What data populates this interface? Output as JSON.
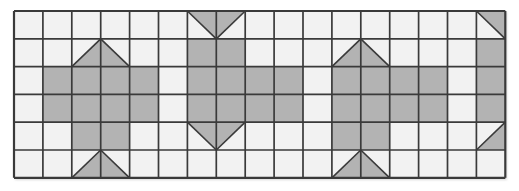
{
  "figure": {
    "title": "Quilt block grid pattern",
    "kind": "grid-tiling",
    "columns": 17,
    "rows": 6,
    "origin": {
      "x": 14,
      "y": 11
    },
    "cell_width": 28.9,
    "cell_height": 27.8
  },
  "colors": {
    "background": "#ffffff",
    "cell_empty": "#f2f2f2",
    "cell_filled": "#b3b3b3",
    "grid_line": "#3a3a3a",
    "outer_shadow": "#d9d9d9"
  },
  "legend": {
    "empty_label": "empty",
    "filled_label": "filled",
    "tri_up_label": "triangle-up",
    "tri_down_label": "triangle-down",
    "tri_ne_label": "triangle-upper-right",
    "tri_se_label": "triangle-lower-right"
  },
  "chart_data": {
    "type": "heatmap",
    "title": "Quilt block grid pattern",
    "xlabel": "",
    "ylabel": "",
    "categories": [
      "1",
      "2",
      "3",
      "4",
      "5",
      "6",
      "7",
      "8",
      "9",
      "10",
      "11",
      "12",
      "13",
      "14",
      "15",
      "16",
      "17"
    ],
    "row_labels": [
      "1",
      "2",
      "3",
      "4",
      "5",
      "6"
    ],
    "legend_position": "none",
    "grid": true,
    "cell_codes": {
      "0": "empty",
      "1": "filled",
      "u": "triangle pointing up (lower half diagonal split, left cell = NE half, right cell = NW half)",
      "d": "triangle pointing down (upper half diagonal split, left cell = SE half, right cell = SW half)",
      "ne": "upper-right half filled",
      "se": "lower-right half filled"
    },
    "cells": [
      [
        "0",
        "0",
        "0",
        "0",
        "0",
        "0",
        "dL",
        "dR",
        "0",
        "0",
        "0",
        "0",
        "0",
        "0",
        "0",
        "0",
        "ne"
      ],
      [
        "0",
        "0",
        "uL",
        "uR",
        "0",
        "0",
        "1",
        "1",
        "0",
        "0",
        "0",
        "uL",
        "uR",
        "0",
        "0",
        "0",
        "1"
      ],
      [
        "0",
        "1",
        "1",
        "1",
        "1",
        "0",
        "1",
        "1",
        "1",
        "1",
        "0",
        "1",
        "1",
        "1",
        "1",
        "0",
        "1"
      ],
      [
        "0",
        "1",
        "1",
        "1",
        "1",
        "0",
        "1",
        "1",
        "1",
        "1",
        "0",
        "1",
        "1",
        "1",
        "1",
        "0",
        "1"
      ],
      [
        "0",
        "0",
        "1",
        "1",
        "0",
        "0",
        "dL",
        "dR",
        "0",
        "0",
        "0",
        "1",
        "1",
        "0",
        "0",
        "0",
        "se"
      ],
      [
        "0",
        "0",
        "uL",
        "uR",
        "0",
        "0",
        "0",
        "0",
        "0",
        "0",
        "0",
        "uL",
        "uR",
        "0",
        "0",
        "0",
        "0"
      ]
    ]
  }
}
